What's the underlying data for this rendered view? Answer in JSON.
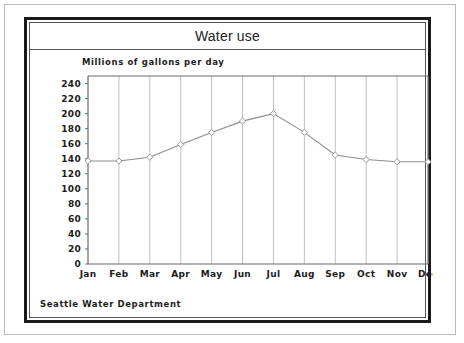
{
  "card": {
    "title": "Water use",
    "axis_label": "Millions of gallons per day",
    "footer": "Seattle Water Department"
  },
  "chart_data": {
    "type": "line",
    "title": "Water use",
    "xlabel": "",
    "ylabel": "Millions of gallons per day",
    "categories": [
      "Jan",
      "Feb",
      "Mar",
      "Apr",
      "May",
      "Jun",
      "Jul",
      "Aug",
      "Sep",
      "Oct",
      "Nov",
      "Dec"
    ],
    "values": [
      137,
      137,
      142,
      159,
      175,
      190,
      200,
      175,
      145,
      139,
      136,
      136
    ],
    "ylim": [
      0,
      250
    ],
    "ytick_values": [
      0,
      20,
      40,
      60,
      80,
      100,
      120,
      140,
      160,
      180,
      200,
      220,
      240
    ],
    "ytick_labels": [
      "0",
      "20",
      "40",
      "60",
      "80",
      "100",
      "120",
      "140",
      "160",
      "180",
      "200",
      "220",
      "240"
    ],
    "grid": "vertical-only",
    "legend": "none",
    "line_color": "#8d8d8d",
    "marker": "diamond",
    "marker_color": "#9a9a9a",
    "axis_color": "#6b6b6b",
    "grid_color": "#b0b0b0",
    "annotations": [
      "Seattle Water Department"
    ]
  },
  "colors": {
    "card_border": "#1a1a1a",
    "text": "#1c1c1c",
    "title_text": "#222222",
    "page_frame": "#b9b9b9"
  }
}
